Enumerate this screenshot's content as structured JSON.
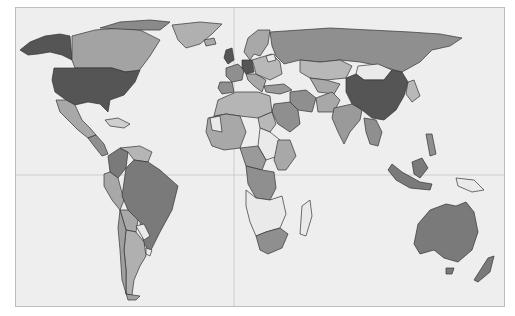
{
  "map": {
    "type": "choropleth",
    "projection": "miller-cylindrical",
    "background_color": "#eeeeee",
    "frame_color": "#bdbdbd",
    "gridlines": {
      "prime_meridian_x": 234,
      "equator_y": 175,
      "color": "#c4c4c4"
    },
    "shade_levels": {
      "darkest": "#555555",
      "dark": "#7a7a7a",
      "medium": "#9a9a9a",
      "light": "#b8b8b8",
      "lightest": "#eaeaea"
    },
    "countries": [
      {
        "name": "United States",
        "shade": "darkest"
      },
      {
        "name": "China",
        "shade": "darkest"
      },
      {
        "name": "Germany",
        "shade": "darkest"
      },
      {
        "name": "United Kingdom",
        "shade": "darkest"
      },
      {
        "name": "Canada",
        "shade": "light"
      },
      {
        "name": "Mexico",
        "shade": "light"
      },
      {
        "name": "Brazil",
        "shade": "dark"
      },
      {
        "name": "Colombia",
        "shade": "dark"
      },
      {
        "name": "Argentina",
        "shade": "light"
      },
      {
        "name": "Russia",
        "shade": "dark"
      },
      {
        "name": "India",
        "shade": "medium"
      },
      {
        "name": "Australia",
        "shade": "dark"
      },
      {
        "name": "Indonesia",
        "shade": "dark"
      },
      {
        "name": "South Africa",
        "shade": "dark"
      },
      {
        "name": "Mongolia",
        "shade": "lightest"
      },
      {
        "name": "Sudan",
        "shade": "lightest"
      },
      {
        "name": "Greenland",
        "shade": "light"
      },
      {
        "name": "Kazakhstan",
        "shade": "light"
      },
      {
        "name": "Saudi Arabia",
        "shade": "dark"
      },
      {
        "name": "DR Congo",
        "shade": "dark"
      },
      {
        "name": "Madagascar",
        "shade": "lightest"
      },
      {
        "name": "New Zealand",
        "shade": "dark"
      }
    ]
  }
}
